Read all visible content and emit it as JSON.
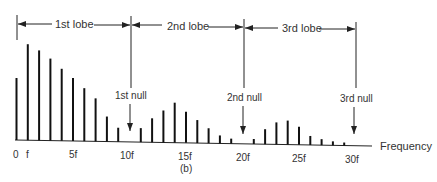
{
  "chart_data": {
    "type": "bar",
    "title": "",
    "caption": "(b)",
    "xlabel": "Frequency",
    "ylabel": "",
    "grid": false,
    "x": [
      0,
      1,
      2,
      3,
      4,
      5,
      6,
      7,
      8,
      9,
      10,
      11,
      12,
      13,
      14,
      15,
      16,
      17,
      18,
      19,
      20,
      21,
      22,
      23,
      24,
      25,
      26,
      27,
      28,
      29
    ],
    "values": [
      62,
      96,
      90,
      82,
      72,
      63,
      53,
      43,
      25,
      14,
      0,
      14,
      24,
      32,
      40,
      31,
      23,
      15,
      8,
      5,
      0,
      5,
      15,
      22,
      24,
      18,
      9,
      6,
      4,
      3
    ],
    "tick_labels": [
      "0",
      "f",
      "5f",
      "10f",
      "15f",
      "20f",
      "25f",
      "30f"
    ],
    "tick_positions": [
      0,
      1,
      5,
      10,
      15,
      20,
      25,
      30
    ],
    "lobes": [
      {
        "label": "1st lobe",
        "from": 0,
        "to": 10
      },
      {
        "label": "2nd lobe",
        "from": 10,
        "to": 20
      },
      {
        "label": "3rd lobe",
        "from": 20,
        "to": 30
      }
    ],
    "nulls": [
      {
        "label": "1st null",
        "at": 10
      },
      {
        "label": "2nd null",
        "at": 20
      },
      {
        "label": "3rd null",
        "at": 30
      }
    ]
  },
  "labels": {
    "lobe1": "1st lobe",
    "lobe2": "2nd lobe",
    "lobe3": "3rd lobe",
    "null1": "1st null",
    "null2": "2nd null",
    "null3": "3rd null",
    "xaxis": "Frequency",
    "caption": "(b)",
    "ticks": [
      "0",
      "f",
      "5f",
      "10f",
      "15f",
      "20f",
      "25f",
      "30f"
    ]
  }
}
